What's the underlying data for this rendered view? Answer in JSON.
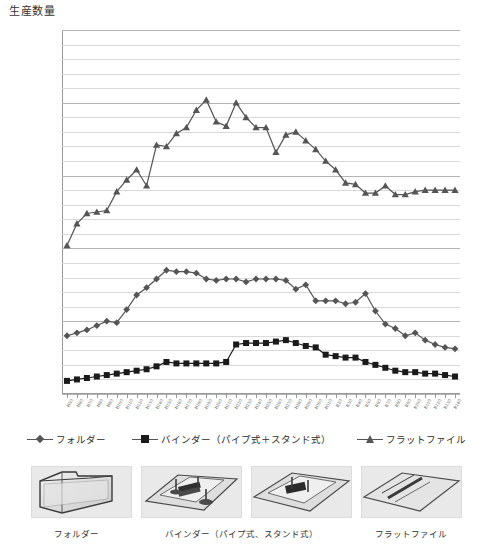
{
  "chart_data": {
    "type": "line",
    "title": "生産数量",
    "xlabel": "",
    "ylabel": "生産数量",
    "ylim": [
      0,
      250000000
    ],
    "ytick_step": 50000000,
    "minor_gridline_step": 10000000,
    "grid": true,
    "legend_position": "bottom",
    "ytick_labels": [
      "250,000,000",
      "200,000,000",
      "150,000,000",
      "100,000,000",
      "50,000,000",
      "0"
    ],
    "ytick_values": [
      250000000,
      200000000,
      150000000,
      100000000,
      50000000,
      0
    ],
    "categories": [
      "H5/3",
      "H6/3",
      "H7/3",
      "H8/3",
      "H9/3",
      "H10/3",
      "H11/3",
      "H12/3",
      "H13/3",
      "H14/3",
      "H15/3",
      "H16/3",
      "H17/3",
      "H18/3",
      "H19/3",
      "H20/3",
      "H21/3",
      "H22/3",
      "H23/3",
      "H24/3",
      "H25/3",
      "H26/3",
      "H27/3",
      "H28/3",
      "H29/3",
      "H30/3",
      "H31/3",
      "R2/3",
      "R3/3",
      "R4/3",
      "R5/3",
      "R6/3",
      "R7/3",
      "R8/3",
      "R9/3",
      "R10/3",
      "R11/3",
      "R12/3",
      "R13/3",
      "R14/3"
    ],
    "series": [
      {
        "name": "フォルダー",
        "marker": "diamond",
        "color": "#555555",
        "values": [
          40000000,
          42000000,
          44000000,
          47000000,
          50000000,
          49000000,
          58000000,
          68000000,
          73000000,
          79000000,
          85000000,
          84000000,
          84000000,
          83000000,
          79000000,
          78000000,
          79000000,
          79000000,
          77000000,
          79000000,
          79000000,
          79000000,
          78000000,
          72000000,
          75000000,
          64000000,
          64000000,
          64000000,
          62000000,
          63000000,
          69000000,
          57000000,
          48000000,
          45000000,
          40000000,
          42000000,
          37000000,
          34000000,
          32000000,
          31000000
        ]
      },
      {
        "name": "バインダー（パイプ式＋スタンド式）",
        "marker": "square",
        "color": "#1a1a1a",
        "values": [
          9000000,
          10000000,
          11000000,
          12000000,
          13000000,
          14000000,
          15000000,
          16000000,
          17000000,
          19000000,
          22000000,
          21000000,
          21000000,
          21000000,
          21000000,
          21000000,
          22000000,
          34000000,
          35000000,
          35000000,
          35000000,
          36000000,
          37000000,
          35000000,
          33000000,
          32000000,
          27000000,
          26000000,
          25000000,
          25000000,
          22000000,
          20000000,
          18000000,
          16000000,
          15000000,
          15000000,
          14000000,
          14000000,
          13000000,
          12000000
        ]
      },
      {
        "name": "フラットファイル",
        "marker": "triangle",
        "color": "#555555",
        "values": [
          102000000,
          117000000,
          124000000,
          125000000,
          126000000,
          139000000,
          147000000,
          154000000,
          143000000,
          171000000,
          170000000,
          179000000,
          183000000,
          195000000,
          202000000,
          187000000,
          184000000,
          200000000,
          190000000,
          183000000,
          183000000,
          166000000,
          178000000,
          180000000,
          174000000,
          168000000,
          160000000,
          154000000,
          145000000,
          144000000,
          138000000,
          138000000,
          143000000,
          137000000,
          137000000,
          139000000,
          140000000,
          140000000,
          140000000,
          140000000
        ]
      }
    ]
  },
  "legend": {
    "items": [
      {
        "label": "フォルダー",
        "marker": "diamond"
      },
      {
        "label": "バインダー（パイプ式＋スタンド式）",
        "marker": "square"
      },
      {
        "label": "フラットファイル",
        "marker": "triangle"
      }
    ]
  },
  "photos": {
    "captions": [
      "フォルダー",
      "バインダー（パイプ式、スタンド式）",
      "フラットファイル"
    ],
    "items": [
      {
        "name": "folder-photo"
      },
      {
        "name": "pipe-binder-photo"
      },
      {
        "name": "stand-binder-photo"
      },
      {
        "name": "flat-file-photo"
      }
    ]
  }
}
